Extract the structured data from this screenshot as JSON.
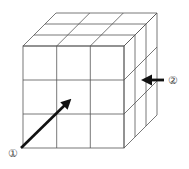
{
  "diagram": {
    "type": "3x3x3 cube of unit cubes (isometric-style drawing)",
    "grid_size": 3,
    "line_color": "#555555",
    "arrow_color": "#111111",
    "labels": {
      "arrow1": "①",
      "arrow2": "②"
    },
    "arrows": [
      {
        "id": "arrow-1",
        "label": "①",
        "direction": "diagonal into front face, from bottom-left toward center"
      },
      {
        "id": "arrow-2",
        "label": "②",
        "direction": "horizontal into right side face, pointing left"
      }
    ]
  }
}
